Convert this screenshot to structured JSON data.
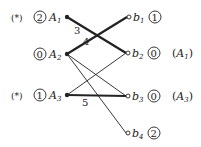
{
  "diagram": {
    "type": "bipartite-graph-matching",
    "left_nodes": [
      {
        "id": "A1",
        "name": "A",
        "sub": "1",
        "label_value": "2",
        "marked": "(*)",
        "x": 67,
        "y": 17
      },
      {
        "id": "A2",
        "name": "A",
        "sub": "2",
        "label_value": "0",
        "marked": "",
        "x": 67,
        "y": 54
      },
      {
        "id": "A3",
        "name": "A",
        "sub": "3",
        "label_value": "1",
        "marked": "(*)",
        "x": 67,
        "y": 95
      }
    ],
    "right_nodes": [
      {
        "id": "b1",
        "name": "b",
        "sub": "1",
        "label_value": "1",
        "annotation": "",
        "x": 129,
        "y": 17
      },
      {
        "id": "b2",
        "name": "b",
        "sub": "2",
        "label_value": "0",
        "annotation": "(A1)",
        "ann_name": "A",
        "ann_sub": "1",
        "x": 128,
        "y": 53
      },
      {
        "id": "b3",
        "name": "b",
        "sub": "3",
        "label_value": "0",
        "annotation": "(A3)",
        "ann_name": "A",
        "ann_sub": "3",
        "x": 128,
        "y": 96
      },
      {
        "id": "b4",
        "name": "b",
        "sub": "4",
        "label_value": "2",
        "annotation": "",
        "x": 128,
        "y": 133
      }
    ],
    "edges": [
      {
        "from": "A1",
        "to": "b2",
        "weight": "3",
        "bold": true
      },
      {
        "from": "A2",
        "to": "b1",
        "weight": "4",
        "bold": true
      },
      {
        "from": "A2",
        "to": "b3",
        "weight": "",
        "bold": false
      },
      {
        "from": "A2",
        "to": "b4",
        "weight": "",
        "bold": false
      },
      {
        "from": "A3",
        "to": "b2",
        "weight": "",
        "bold": false
      },
      {
        "from": "A3",
        "to": "b3",
        "weight": "5",
        "bold": true
      }
    ],
    "colors": {
      "ink": "#222222",
      "background": "#ffffff"
    }
  }
}
